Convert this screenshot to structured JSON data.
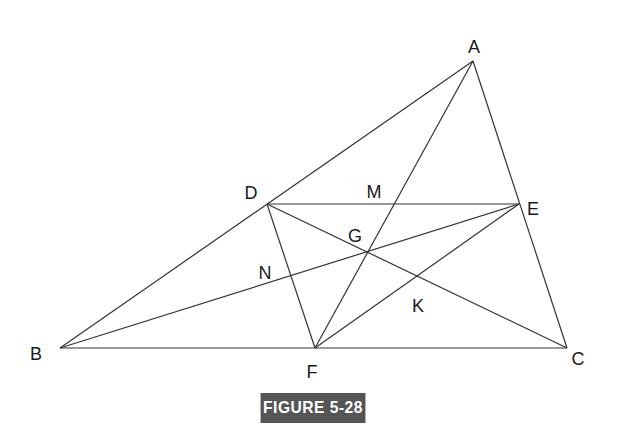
{
  "figure": {
    "caption": "FIGURE 5-28",
    "caption_bg": "#555555",
    "caption_fg": "#ffffff",
    "line_color": "#333333"
  },
  "points": {
    "A": {
      "label": "A",
      "x": 473,
      "y": 61,
      "lx": 474,
      "ly": 48
    },
    "B": {
      "label": "B",
      "x": 60,
      "y": 348,
      "lx": 36,
      "ly": 355
    },
    "C": {
      "label": "C",
      "x": 567,
      "y": 348,
      "lx": 578,
      "ly": 360
    },
    "D": {
      "label": "D",
      "x": 267,
      "y": 204,
      "lx": 251,
      "ly": 194
    },
    "E": {
      "label": "E",
      "x": 519,
      "y": 204,
      "lx": 533,
      "ly": 210
    },
    "F": {
      "label": "F",
      "x": 315,
      "y": 348,
      "lx": 312,
      "ly": 373
    },
    "G": {
      "label": "G",
      "x": 369,
      "y": 252,
      "lx": 355,
      "ly": 237
    },
    "M": {
      "label": "M",
      "lx": 374,
      "ly": 193
    },
    "N": {
      "label": "N",
      "lx": 265,
      "ly": 274
    },
    "K": {
      "label": "K",
      "lx": 418,
      "ly": 307
    }
  },
  "segments": [
    {
      "name": "AB",
      "from": "A",
      "to": "B"
    },
    {
      "name": "AC",
      "from": "A",
      "to": "C"
    },
    {
      "name": "BC",
      "from": "B",
      "to": "C"
    },
    {
      "name": "DE",
      "from": "D",
      "to": "E"
    },
    {
      "name": "DF",
      "from": "D",
      "to": "F"
    },
    {
      "name": "DC",
      "from": "D",
      "to": "C"
    },
    {
      "name": "BE",
      "from": "B",
      "to": "E"
    },
    {
      "name": "AF",
      "from": "A",
      "to": "F"
    },
    {
      "name": "EF",
      "from": "E",
      "to": "F"
    }
  ]
}
